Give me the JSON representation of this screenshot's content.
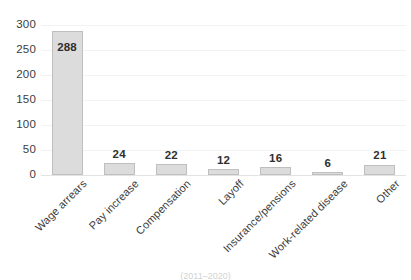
{
  "chart_data": {
    "type": "bar",
    "title": "",
    "subtitle": "",
    "xlabel": "",
    "ylabel": "",
    "categories": [
      "Wage arrears",
      "Pay increase",
      "Compensation",
      "Layoff",
      "Insurance/pensions",
      "Work-related disease",
      "Other"
    ],
    "values": [
      288,
      24,
      22,
      12,
      16,
      6,
      21
    ],
    "data_labels": [
      "288",
      "24",
      "22",
      "12",
      "16",
      "6",
      "21"
    ],
    "ylim": [
      0,
      300
    ],
    "ytick_values": [
      0,
      50,
      100,
      150,
      200,
      250,
      300
    ],
    "ytick_labels": [
      "0",
      "50",
      "100",
      "150",
      "200",
      "250",
      "300"
    ],
    "grid": true,
    "grid_axis": "y",
    "legend": false,
    "legend_position": "none",
    "bar_fill_color": "#dcdcdc",
    "bar_border_color": "#bfbfbf",
    "gridline_color": "#f2f2f2",
    "axis_line_color": "#e3e3e3",
    "text_color": "#3b3b3b",
    "xtick_label_rotation": -45
  },
  "caption": {
    "clipped_text": "(2011–2020)"
  }
}
